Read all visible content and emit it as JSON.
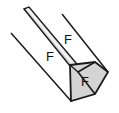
{
  "figure": {
    "kind": "engineering-line-diagram",
    "width": 119,
    "height": 113,
    "background_color": "#ffffff",
    "outline_color": "#1a1a1a",
    "shade_fill_color": "#d4d4d4",
    "band_fill_color": "#cfcfcf",
    "labels": [
      {
        "id": "force-label-upper",
        "text": "F",
        "x": 68,
        "y": 41
      },
      {
        "id": "force-label-left",
        "text": "F",
        "x": 50,
        "y": 58
      },
      {
        "id": "force-label-head",
        "text": "F",
        "x": 85,
        "y": 83
      }
    ],
    "shapes": {
      "web_band": {
        "name": "diagonal-web-band",
        "points": "24,9 29,7 77,64 70,66"
      },
      "arrow_head": {
        "name": "shaded-arrowhead",
        "points": "70,65 95,62 108,72 95,94 71,101"
      },
      "upper_right_edge": {
        "name": "upper-right-edge-line",
        "x1": 62,
        "y1": 14,
        "x2": 108,
        "y2": 72
      },
      "lower_left_edge": {
        "name": "lower-left-edge-line",
        "x1": 11,
        "y1": 33,
        "x2": 71,
        "y2": 101
      },
      "head_inner_crease": {
        "name": "arrowhead-inner-crease",
        "points": "95,62 78,72 95,94"
      }
    },
    "top_artifacts": [
      {
        "id": "artifact-1",
        "x": 9,
        "y": 0,
        "w": 5,
        "h": 3
      },
      {
        "id": "artifact-2",
        "x": 30,
        "y": 1,
        "w": 4,
        "h": 3
      },
      {
        "id": "artifact-3",
        "x": 63,
        "y": 0,
        "w": 5,
        "h": 3
      },
      {
        "id": "artifact-4",
        "x": 93,
        "y": 0,
        "w": 5,
        "h": 4
      }
    ]
  }
}
